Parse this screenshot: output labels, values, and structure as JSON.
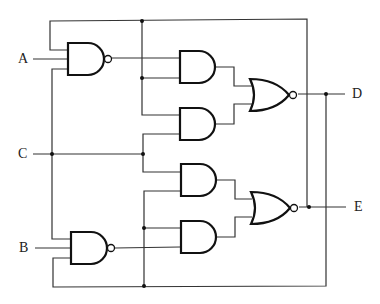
{
  "diagram": {
    "type": "logic-circuit",
    "inputs": [
      {
        "label": "A",
        "x": 18,
        "y": 52
      },
      {
        "label": "C",
        "x": 18,
        "y": 147
      },
      {
        "label": "B",
        "x": 18,
        "y": 241
      }
    ],
    "outputs": [
      {
        "label": "D",
        "x": 324,
        "y": 87
      },
      {
        "label": "E",
        "x": 326,
        "y": 200
      }
    ],
    "gates": [
      {
        "id": "nand1",
        "kind": "NAND",
        "inputs": [
          "top-loop",
          "A",
          "C"
        ]
      },
      {
        "id": "nand2",
        "kind": "NAND",
        "inputs": [
          "C",
          "B",
          "bottom-loop"
        ]
      },
      {
        "id": "and1",
        "kind": "AND",
        "inputs": [
          "nand1",
          "top-loop"
        ]
      },
      {
        "id": "and2",
        "kind": "AND",
        "inputs": [
          "top-loop",
          "C"
        ]
      },
      {
        "id": "and3",
        "kind": "AND",
        "inputs": [
          "C",
          "bottom-loop"
        ]
      },
      {
        "id": "and4",
        "kind": "AND",
        "inputs": [
          "bottom-loop",
          "nand2"
        ]
      },
      {
        "id": "nor1",
        "kind": "NOR",
        "inputs": [
          "and1",
          "and2"
        ],
        "output": "D"
      },
      {
        "id": "nor2",
        "kind": "NOR",
        "inputs": [
          "and3",
          "and4"
        ],
        "output": "E"
      }
    ]
  }
}
